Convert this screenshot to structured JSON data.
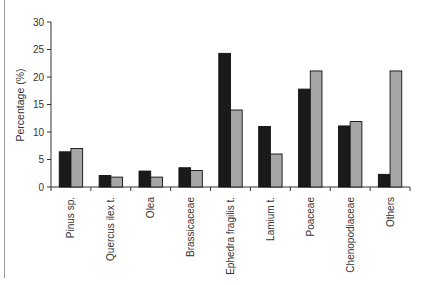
{
  "chart_data": {
    "type": "bar",
    "title": "",
    "xlabel": "",
    "ylabel": "Percentage (%)",
    "ylim": [
      0,
      30
    ],
    "yticks": [
      0,
      5,
      10,
      15,
      20,
      25,
      30
    ],
    "grid": false,
    "legend": null,
    "categories": [
      "Pinus sp.",
      "Quercus ilex t.",
      "Olea",
      "Brassicaceae",
      "Ephedra fragilis t.",
      "Lamium t.",
      "Poaceae",
      "Chenopodiaceae",
      "Others"
    ],
    "series": [
      {
        "name": "Series 1",
        "color": "#1a1a1a",
        "values": [
          6.4,
          2.1,
          2.9,
          3.5,
          24.3,
          11.0,
          17.8,
          11.1,
          2.3
        ]
      },
      {
        "name": "Series 2",
        "color": "#a6a6a6",
        "values": [
          7.0,
          1.8,
          1.8,
          3.0,
          14.0,
          6.0,
          21.1,
          11.9,
          21.1
        ]
      }
    ]
  }
}
